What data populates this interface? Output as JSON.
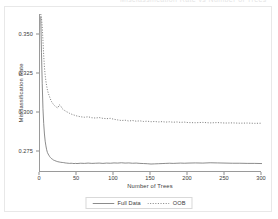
{
  "figure": {
    "clipped_title": "Misclassification Rate vs Number of Trees"
  },
  "chart_data": {
    "type": "line",
    "title": "",
    "xlabel": "Number of Trees",
    "ylabel": "Misclassification Rate",
    "xlim": [
      0,
      300
    ],
    "ylim": [
      0.2615,
      0.3625
    ],
    "grid": false,
    "legend_position": "bottom-center",
    "xticks": [
      0,
      50,
      100,
      150,
      200,
      250,
      300
    ],
    "xtick_labels": [
      "0",
      "50",
      "100",
      "150",
      "200",
      "250",
      "300"
    ],
    "yticks": [
      0.275,
      0.3,
      0.325,
      0.35
    ],
    "ytick_labels": [
      "0.275",
      "0.300",
      "0.325",
      "0.350"
    ],
    "x": [
      1,
      2,
      3,
      4,
      5,
      6,
      7,
      8,
      9,
      10,
      11,
      12,
      13,
      14,
      15,
      16,
      17,
      18,
      19,
      20,
      22,
      24,
      26,
      28,
      30,
      32,
      34,
      36,
      38,
      40,
      42,
      44,
      46,
      48,
      50,
      55,
      60,
      65,
      70,
      75,
      80,
      85,
      90,
      95,
      100,
      105,
      110,
      115,
      120,
      125,
      130,
      135,
      140,
      145,
      150,
      155,
      160,
      165,
      170,
      175,
      180,
      185,
      190,
      195,
      200,
      210,
      220,
      230,
      240,
      250,
      260,
      270,
      280,
      290,
      300
    ],
    "series": [
      {
        "name": "Full Data",
        "style": "solid",
        "color": "#6e6e6e",
        "values": [
          0.361,
          0.338,
          0.318,
          0.302,
          0.2925,
          0.2858,
          0.2812,
          0.2782,
          0.2757,
          0.274,
          0.273,
          0.2722,
          0.2714,
          0.2708,
          0.2703,
          0.2699,
          0.2696,
          0.2692,
          0.269,
          0.2688,
          0.2684,
          0.2681,
          0.2679,
          0.2677,
          0.2676,
          0.2675,
          0.2673,
          0.2672,
          0.2671,
          0.267,
          0.2671,
          0.267,
          0.2669,
          0.267,
          0.2669,
          0.2671,
          0.267,
          0.2672,
          0.267,
          0.2671,
          0.2672,
          0.267,
          0.2672,
          0.2671,
          0.2673,
          0.2672,
          0.2674,
          0.2672,
          0.2673,
          0.2671,
          0.2672,
          0.267,
          0.2669,
          0.2668,
          0.2666,
          0.2667,
          0.2668,
          0.2669,
          0.267,
          0.2671,
          0.267,
          0.2671,
          0.2672,
          0.2671,
          0.2672,
          0.2673,
          0.2672,
          0.2674,
          0.2673,
          0.2672,
          0.2671,
          0.2671,
          0.267,
          0.267,
          0.2669
        ]
      },
      {
        "name": "OOB",
        "style": "dotted",
        "color": "#6e6e6e",
        "values": [
          0.3625,
          0.36,
          0.3545,
          0.3455,
          0.336,
          0.3285,
          0.3232,
          0.3195,
          0.3165,
          0.314,
          0.3122,
          0.3108,
          0.3095,
          0.3082,
          0.307,
          0.3062,
          0.3055,
          0.3048,
          0.3042,
          0.3038,
          0.303,
          0.3024,
          0.3045,
          0.3038,
          0.302,
          0.3012,
          0.3006,
          0.3,
          0.2996,
          0.299,
          0.2986,
          0.2982,
          0.2979,
          0.2976,
          0.2973,
          0.2968,
          0.2965,
          0.2968,
          0.2962,
          0.296,
          0.2963,
          0.2958,
          0.2956,
          0.2958,
          0.2952,
          0.2948,
          0.2944,
          0.2946,
          0.2941,
          0.2944,
          0.294,
          0.2942,
          0.2938,
          0.294,
          0.2936,
          0.2938,
          0.2935,
          0.2937,
          0.2934,
          0.2936,
          0.2933,
          0.2935,
          0.2932,
          0.2934,
          0.2931,
          0.293,
          0.2932,
          0.2929,
          0.2931,
          0.2928,
          0.2929,
          0.2927,
          0.2928,
          0.2926,
          0.2927
        ]
      }
    ]
  }
}
